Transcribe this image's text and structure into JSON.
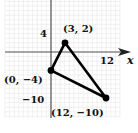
{
  "chart_data": {
    "type": "scatter",
    "title": "",
    "xlabel": "x",
    "ylabel": "",
    "xlim": [
      -10,
      15
    ],
    "ylim": [
      -14,
      11
    ],
    "grid": true,
    "tick_labels": {
      "x": [
        {
          "value": 12,
          "label": "12"
        }
      ],
      "y": [
        {
          "value": 4,
          "label": "4"
        },
        {
          "value": -10,
          "label": "-10"
        }
      ]
    },
    "series": [
      {
        "name": "triangle",
        "closed": true,
        "points": [
          {
            "x": 3,
            "y": 2,
            "label": "(3, 2)"
          },
          {
            "x": 12,
            "y": -10,
            "label": "(12, −10)"
          },
          {
            "x": 0,
            "y": -4,
            "label": "(0, −4)"
          }
        ]
      }
    ],
    "colors": {
      "grid": "#e6e6e6",
      "axes": "#555555",
      "shape": "#000000"
    }
  },
  "labels": {
    "x_axis": "x",
    "tick_x_12": "12",
    "tick_y_4": "4",
    "tick_y_neg10": "−10",
    "point_a": "(3, 2)",
    "point_b": "(0, −4)",
    "point_c": "(12, −10)"
  }
}
